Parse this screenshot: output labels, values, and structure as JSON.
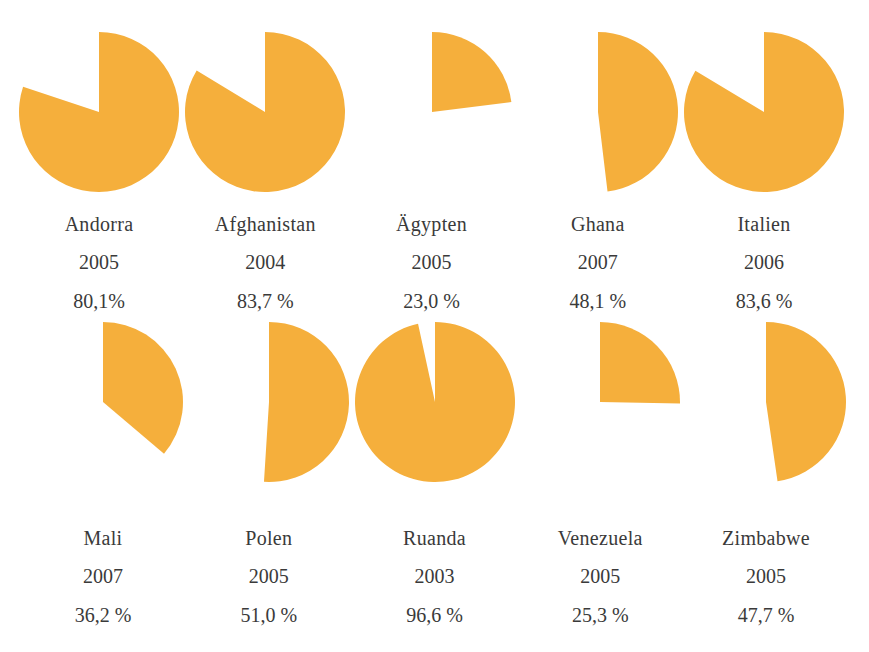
{
  "chart_data": {
    "type": "pie",
    "title": "",
    "subtitle": "",
    "xlabel": "",
    "ylabel": "",
    "legend": [],
    "grid": false,
    "accent_color": "#F5AF3C",
    "background_color": "#FFFFFF",
    "text_color": "#3A3A3A",
    "note": "Ten single-slice pie charts; each slice starts at 12 o'clock and sweeps clockwise by the stated percentage.",
    "rows": [
      {
        "name": "row-1",
        "items": [
          {
            "country": "Andorra",
            "year": "2005",
            "percent_label": "80,1%",
            "value": 80.1
          },
          {
            "country": "Afghanistan",
            "year": "2004",
            "percent_label": "83,7 %",
            "value": 83.7
          },
          {
            "country": "Ägypten",
            "year": "2005",
            "percent_label": "23,0 %",
            "value": 23.0
          },
          {
            "country": "Ghana",
            "year": "2007",
            "percent_label": "48,1 %",
            "value": 48.1
          },
          {
            "country": "Italien",
            "year": "2006",
            "percent_label": "83,6 %",
            "value": 83.6
          }
        ]
      },
      {
        "name": "row-2",
        "items": [
          {
            "country": "Mali",
            "year": "2007",
            "percent_label": "36,2 %",
            "value": 36.2
          },
          {
            "country": "Polen",
            "year": "2005",
            "percent_label": "51,0 %",
            "value": 51.0
          },
          {
            "country": "Ruanda",
            "year": "2003",
            "percent_label": "96,6 %",
            "value": 96.6
          },
          {
            "country": "Venezuela",
            "year": "2005",
            "percent_label": "25,3 %",
            "value": 25.3
          },
          {
            "country": "Zimbabwe",
            "year": "2005",
            "percent_label": "47,7 %",
            "value": 47.7
          }
        ]
      }
    ],
    "categories": [
      "Andorra",
      "Afghanistan",
      "Ägypten",
      "Ghana",
      "Italien",
      "Mali",
      "Polen",
      "Ruanda",
      "Venezuela",
      "Zimbabwe"
    ],
    "values": [
      80.1,
      83.7,
      23.0,
      48.1,
      83.6,
      36.2,
      51.0,
      96.6,
      25.3,
      47.7
    ],
    "years": [
      "2005",
      "2004",
      "2005",
      "2007",
      "2006",
      "2007",
      "2005",
      "2003",
      "2005",
      "2005"
    ],
    "ylim": [
      0,
      100
    ]
  }
}
